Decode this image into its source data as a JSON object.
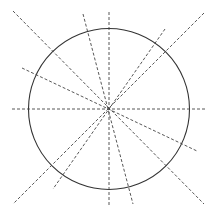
{
  "diagram": {
    "title": "",
    "background": "#ffffff",
    "stroke_color": "#333333",
    "dash_color": "#444444",
    "circle": {
      "cx": 109,
      "cy": 109,
      "r": 80.5
    },
    "center": {
      "x": 109,
      "y": 109
    },
    "lines": [
      {
        "x1": 12,
        "y1": 109,
        "x2": 205,
        "y2": 109
      },
      {
        "x1": 109,
        "y1": 12,
        "x2": 109,
        "y2": 205
      },
      {
        "x1": 13,
        "y1": 11,
        "x2": 204,
        "y2": 204
      },
      {
        "x1": 83,
        "y1": 14,
        "x2": 133,
        "y2": 204
      },
      {
        "x1": 22,
        "y1": 68,
        "x2": 197,
        "y2": 151
      },
      {
        "x1": 204,
        "y1": 13,
        "x2": 13,
        "y2": 204
      },
      {
        "x1": 165,
        "y1": 29,
        "x2": 53,
        "y2": 189
      }
    ]
  }
}
